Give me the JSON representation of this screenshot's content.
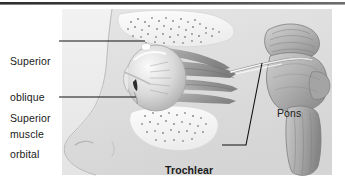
{
  "figure": {
    "kind": "anatomical-illustration",
    "view": "lateral view of right orbit and brainstem",
    "style": "grayscale medical line-and-wash drawing"
  },
  "colors": {
    "background": "#ffffff",
    "top_rule": "#3b3b3b",
    "panel_tint": "#ececed",
    "soft_tissue": "#dedede",
    "bone_light": "#f4f4f4",
    "muscle_mid": "#b9b9b9",
    "muscle_dark": "#8e8e8e",
    "brainstem": "#b4b4b4",
    "nerve": "#f2f2f2",
    "leader_line": "#111111",
    "text": "#1a1a1a"
  },
  "labels": {
    "superior_oblique": {
      "line1": "Superior",
      "line2": "oblique",
      "line3": "muscle",
      "bold": false
    },
    "superior_orbital": {
      "line1": "Superior",
      "line2": "orbital",
      "line3": "fissure",
      "bold": false
    },
    "trochlear_nerve": {
      "line1": "Trochlear",
      "line2": "nerve (IV)",
      "bold": true
    },
    "pons": {
      "line1": "Pons",
      "bold": false
    }
  },
  "structures": [
    {
      "name": "frontal-bone",
      "description": "stippled trabecular bone forming orbital roof"
    },
    {
      "name": "maxilla-bone",
      "description": "stippled trabecular bone below orbit"
    },
    {
      "name": "eyeball",
      "description": "globe seated in anterior orbit"
    },
    {
      "name": "superior-oblique-muscle",
      "description": "muscle passing through trochlea at superomedial orbit"
    },
    {
      "name": "trochlea",
      "description": "white cartilaginous pulley highlight"
    },
    {
      "name": "extraocular-muscle-cone",
      "description": "muscles converging to orbital apex"
    },
    {
      "name": "superior-orbital-fissure",
      "description": "dark slit at orbital apex"
    },
    {
      "name": "trochlear-nerve",
      "description": "thin pale nerve curving from dorsal midbrain around brainstem to orbit"
    },
    {
      "name": "midbrain",
      "description": "upper brainstem segment with colliculi"
    },
    {
      "name": "pons",
      "description": "bulging middle brainstem segment"
    },
    {
      "name": "medulla-oblongata",
      "description": "lower brainstem segment with longitudinal striations"
    },
    {
      "name": "face-profile",
      "description": "silhouette of nose and cheek"
    }
  ]
}
